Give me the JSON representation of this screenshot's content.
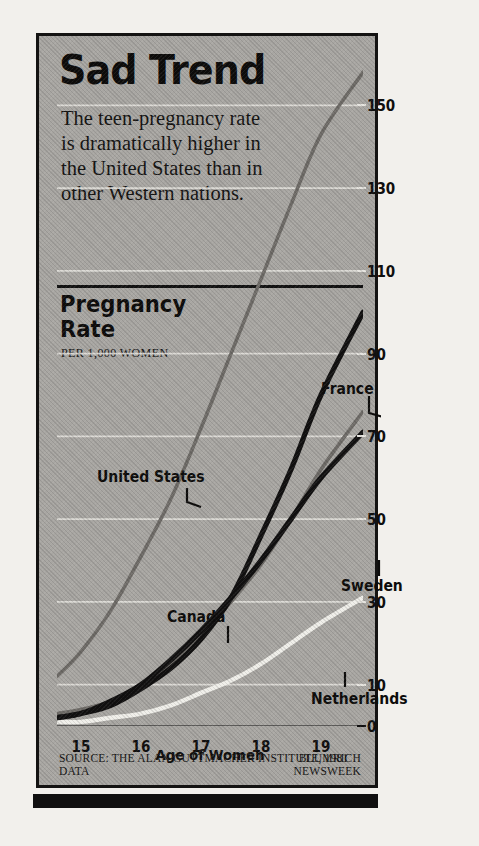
{
  "headline": "Sad Trend",
  "deck": "The teen-pregnancy rate is dramatically higher in the United States than in other Western nations.",
  "panel_title": "Pregnancy Rate",
  "panel_subtitle": "PER 1,000 WOMEN",
  "source": "SOURCE: THE ALAN GUTTMACHER INSTITUTE, 1981 DATA",
  "credit_line1": "BLUMRICH",
  "credit_line2": "NEWSWEEK",
  "colors": {
    "panel_bg": "#a8a6a2",
    "ink": "#111010",
    "united_states": "#6e6b67",
    "canada": "#6e6b67",
    "france": "#111010",
    "sweden": "#111010",
    "netherlands": "#f0efea",
    "gridline": "#e6e4df"
  },
  "chart_data": {
    "type": "line",
    "title": "Pregnancy Rate",
    "subtitle": "PER 1,000 WOMEN",
    "xlabel": "Age of Women",
    "ylabel": "Pregnancy Rate per 1,000 Women",
    "xticklabels": [
      "15",
      "16",
      "17",
      "18",
      "19"
    ],
    "xticks": [
      15,
      16,
      17,
      18,
      19
    ],
    "yticklabels": [
      "0",
      "10",
      "30",
      "50",
      "70",
      "90",
      "110",
      "130",
      "150"
    ],
    "yticks": [
      0,
      10,
      30,
      50,
      70,
      90,
      110,
      130,
      150
    ],
    "xlim": [
      14.6,
      19.7
    ],
    "ylim": [
      0,
      160
    ],
    "grid": true,
    "legend_position": "inline-annotations",
    "x": [
      14.6,
      15,
      15.5,
      16,
      16.5,
      17,
      17.5,
      18,
      18.5,
      19,
      19.7
    ],
    "series": [
      {
        "name": "United States",
        "label": "United States",
        "color": "#6e6b67",
        "values": [
          12,
          18,
          28,
          41,
          55,
          72,
          90,
          108,
          126,
          143,
          158
        ]
      },
      {
        "name": "Canada",
        "label": "Canada",
        "color": "#6e6b67",
        "values": [
          3,
          4,
          6,
          10,
          15,
          22,
          30,
          39,
          50,
          62,
          76
        ]
      },
      {
        "name": "France",
        "label": "France",
        "color": "#111010",
        "values": [
          2,
          3,
          5,
          9,
          14,
          21,
          31,
          46,
          62,
          80,
          100
        ]
      },
      {
        "name": "Sweden",
        "label": "Sweden",
        "color": "#111010",
        "values": [
          2,
          3,
          6,
          10,
          16,
          23,
          31,
          40,
          50,
          60,
          71
        ]
      },
      {
        "name": "Netherlands",
        "label": "Netherlands",
        "color": "#f0efea",
        "values": [
          1,
          1,
          2,
          3,
          5,
          8,
          11,
          15,
          20,
          25,
          31
        ]
      }
    ]
  },
  "annotations": [
    {
      "name": "united-states",
      "text": "United States"
    },
    {
      "name": "canada",
      "text": "Canada"
    },
    {
      "name": "france",
      "text": "France"
    },
    {
      "name": "sweden",
      "text": "Sweden"
    },
    {
      "name": "netherlands",
      "text": "Netherlands"
    }
  ]
}
